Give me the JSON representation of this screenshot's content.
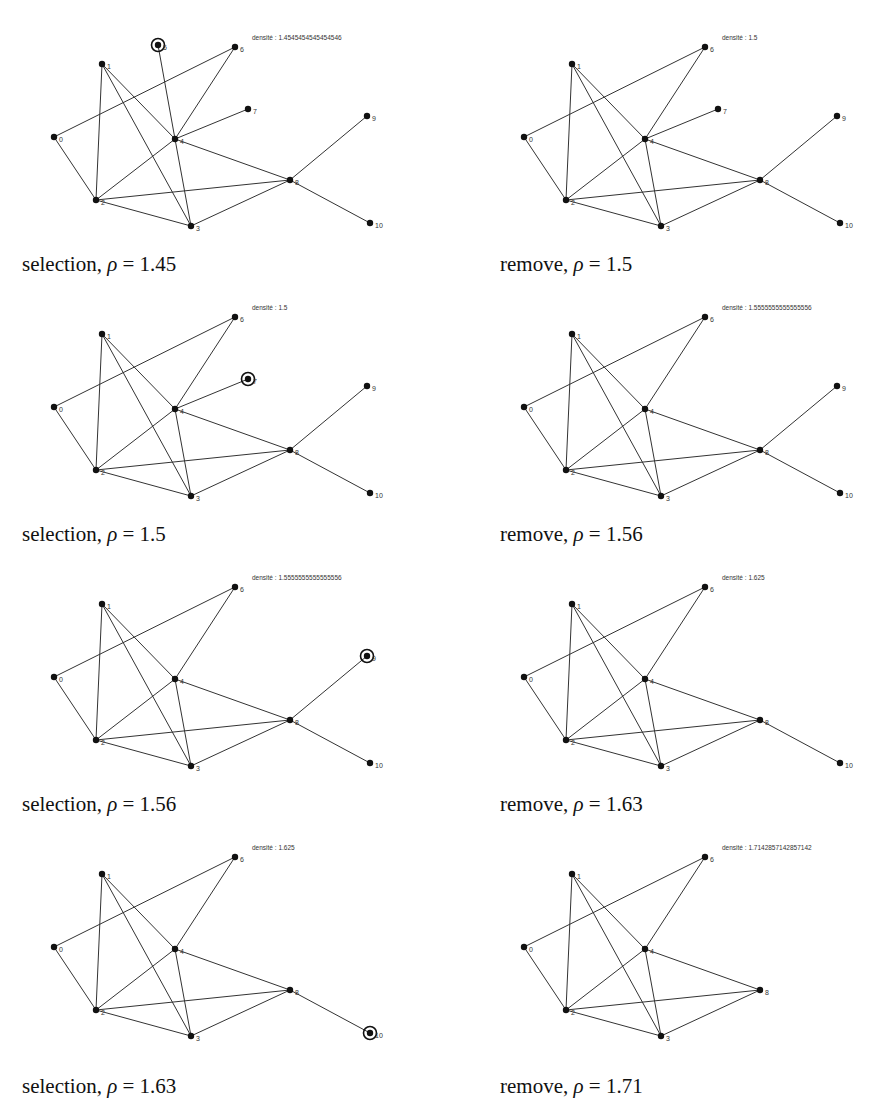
{
  "figure": {
    "node_positions": {
      "0": [
        54,
        137
      ],
      "1": [
        102,
        64
      ],
      "2": [
        96,
        200
      ],
      "3": [
        191,
        226
      ],
      "4": [
        175,
        139
      ],
      "5": [
        158,
        45
      ],
      "6": [
        235,
        47
      ],
      "7": [
        248,
        109
      ],
      "8": [
        290,
        180
      ],
      "9": [
        367,
        116
      ],
      "10": [
        370,
        223
      ]
    },
    "label_map": {
      "0": "0",
      "1": "1",
      "2": "2",
      "3": "3",
      "4": "4",
      "5": "5",
      "6": "6",
      "7": "7",
      "8": "8",
      "9": "9",
      "10": "10"
    },
    "density_label_prefix": "densité : ",
    "panels": [
      {
        "caption_word": "selection",
        "caption_rho": "1.45",
        "caption_full": "selection, ρ = 1.45",
        "density": "1.4545454545454546",
        "col": 0,
        "row": 0,
        "nodes": [
          0,
          1,
          2,
          3,
          4,
          5,
          6,
          7,
          8,
          9,
          10
        ],
        "highlighted": 5,
        "edges": [
          [
            0,
            6
          ],
          [
            0,
            2
          ],
          [
            1,
            2
          ],
          [
            1,
            3
          ],
          [
            1,
            4
          ],
          [
            2,
            4
          ],
          [
            2,
            8
          ],
          [
            2,
            3
          ],
          [
            3,
            4
          ],
          [
            3,
            8
          ],
          [
            4,
            5
          ],
          [
            4,
            6
          ],
          [
            4,
            7
          ],
          [
            4,
            8
          ],
          [
            8,
            9
          ],
          [
            8,
            10
          ]
        ]
      },
      {
        "caption_word": "remove",
        "caption_rho": "1.5",
        "caption_full": "remove, ρ = 1.5",
        "density": "1.5",
        "col": 1,
        "row": 0,
        "nodes": [
          0,
          1,
          2,
          3,
          4,
          6,
          7,
          8,
          9,
          10
        ],
        "highlighted": null,
        "edges": [
          [
            0,
            6
          ],
          [
            0,
            2
          ],
          [
            1,
            2
          ],
          [
            1,
            3
          ],
          [
            1,
            4
          ],
          [
            2,
            4
          ],
          [
            2,
            8
          ],
          [
            2,
            3
          ],
          [
            3,
            4
          ],
          [
            3,
            8
          ],
          [
            4,
            6
          ],
          [
            4,
            7
          ],
          [
            4,
            8
          ],
          [
            8,
            9
          ],
          [
            8,
            10
          ]
        ]
      },
      {
        "caption_word": "selection",
        "caption_rho": "1.5",
        "caption_full": "selection, ρ = 1.5",
        "density": "1.5",
        "col": 0,
        "row": 1,
        "nodes": [
          0,
          1,
          2,
          3,
          4,
          6,
          7,
          8,
          9,
          10
        ],
        "highlighted": 7,
        "edges": [
          [
            0,
            6
          ],
          [
            0,
            2
          ],
          [
            1,
            2
          ],
          [
            1,
            3
          ],
          [
            1,
            4
          ],
          [
            2,
            4
          ],
          [
            2,
            8
          ],
          [
            2,
            3
          ],
          [
            3,
            4
          ],
          [
            3,
            8
          ],
          [
            4,
            6
          ],
          [
            4,
            7
          ],
          [
            4,
            8
          ],
          [
            8,
            9
          ],
          [
            8,
            10
          ]
        ]
      },
      {
        "caption_word": "remove",
        "caption_rho": "1.56",
        "caption_full": "remove, ρ = 1.56",
        "density": "1.5555555555555556",
        "col": 1,
        "row": 1,
        "nodes": [
          0,
          1,
          2,
          3,
          4,
          6,
          8,
          9,
          10
        ],
        "highlighted": null,
        "edges": [
          [
            0,
            6
          ],
          [
            0,
            2
          ],
          [
            1,
            2
          ],
          [
            1,
            3
          ],
          [
            1,
            4
          ],
          [
            2,
            4
          ],
          [
            2,
            8
          ],
          [
            2,
            3
          ],
          [
            3,
            4
          ],
          [
            3,
            8
          ],
          [
            4,
            6
          ],
          [
            4,
            8
          ],
          [
            8,
            9
          ],
          [
            8,
            10
          ]
        ]
      },
      {
        "caption_word": "selection",
        "caption_rho": "1.56",
        "caption_full": "selection, ρ = 1.56",
        "density": "1.5555555555555556",
        "col": 0,
        "row": 2,
        "nodes": [
          0,
          1,
          2,
          3,
          4,
          6,
          8,
          9,
          10
        ],
        "highlighted": 9,
        "edges": [
          [
            0,
            6
          ],
          [
            0,
            2
          ],
          [
            1,
            2
          ],
          [
            1,
            3
          ],
          [
            1,
            4
          ],
          [
            2,
            4
          ],
          [
            2,
            8
          ],
          [
            2,
            3
          ],
          [
            3,
            4
          ],
          [
            3,
            8
          ],
          [
            4,
            6
          ],
          [
            4,
            8
          ],
          [
            8,
            9
          ],
          [
            8,
            10
          ]
        ]
      },
      {
        "caption_word": "remove",
        "caption_rho": "1.63",
        "caption_full": "remove, ρ = 1.63",
        "density": "1.625",
        "col": 1,
        "row": 2,
        "nodes": [
          0,
          1,
          2,
          3,
          4,
          6,
          8,
          10
        ],
        "highlighted": null,
        "edges": [
          [
            0,
            6
          ],
          [
            0,
            2
          ],
          [
            1,
            2
          ],
          [
            1,
            3
          ],
          [
            1,
            4
          ],
          [
            2,
            4
          ],
          [
            2,
            8
          ],
          [
            2,
            3
          ],
          [
            3,
            4
          ],
          [
            3,
            8
          ],
          [
            4,
            6
          ],
          [
            4,
            8
          ],
          [
            8,
            10
          ]
        ]
      },
      {
        "caption_word": "selection",
        "caption_rho": "1.63",
        "caption_full": "selection, ρ = 1.63",
        "density": "1.625",
        "col": 0,
        "row": 3,
        "nodes": [
          0,
          1,
          2,
          3,
          4,
          6,
          8,
          10
        ],
        "highlighted": 10,
        "edges": [
          [
            0,
            6
          ],
          [
            0,
            2
          ],
          [
            1,
            2
          ],
          [
            1,
            3
          ],
          [
            1,
            4
          ],
          [
            2,
            4
          ],
          [
            2,
            8
          ],
          [
            2,
            3
          ],
          [
            3,
            4
          ],
          [
            3,
            8
          ],
          [
            4,
            6
          ],
          [
            4,
            8
          ],
          [
            8,
            10
          ]
        ]
      },
      {
        "caption_word": "remove",
        "caption_rho": "1.71",
        "caption_full": "remove, ρ = 1.71",
        "density": "1.7142857142857142",
        "col": 1,
        "row": 3,
        "nodes": [
          0,
          1,
          2,
          3,
          4,
          6,
          8
        ],
        "highlighted": null,
        "edges": [
          [
            0,
            6
          ],
          [
            0,
            2
          ],
          [
            1,
            2
          ],
          [
            1,
            3
          ],
          [
            1,
            4
          ],
          [
            2,
            4
          ],
          [
            2,
            8
          ],
          [
            2,
            3
          ],
          [
            3,
            4
          ],
          [
            3,
            8
          ],
          [
            4,
            6
          ],
          [
            4,
            8
          ]
        ]
      }
    ]
  }
}
